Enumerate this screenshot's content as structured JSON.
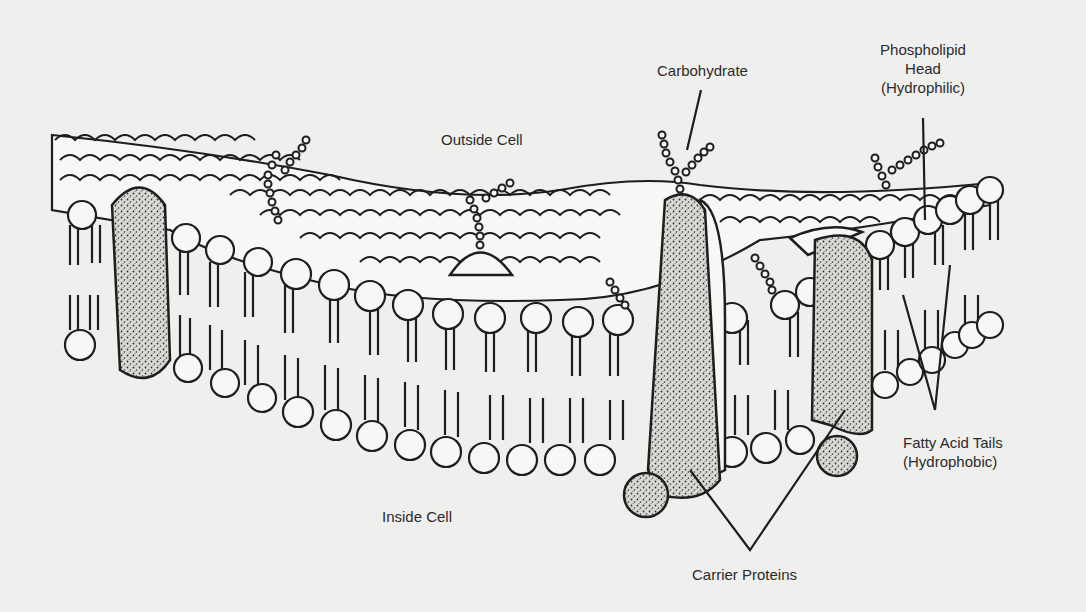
{
  "diagram": {
    "labels": {
      "outside_cell": "Outside Cell",
      "inside_cell": "Inside Cell",
      "carbohydrate": "Carbohydrate",
      "phospholipid_head_line1": "Phospholipid",
      "phospholipid_head_line2": "Head",
      "phospholipid_head_line3": "(Hydrophilic)",
      "fatty_acid_line1": "Fatty Acid Tails",
      "fatty_acid_line2": "(Hydrophobic)",
      "carrier_proteins": "Carrier Proteins"
    },
    "colors": {
      "background": "#efefed",
      "ink": "#1e1e1e",
      "head_fill": "#f7f7f5",
      "protein_fill": "#bdbdb8"
    }
  }
}
